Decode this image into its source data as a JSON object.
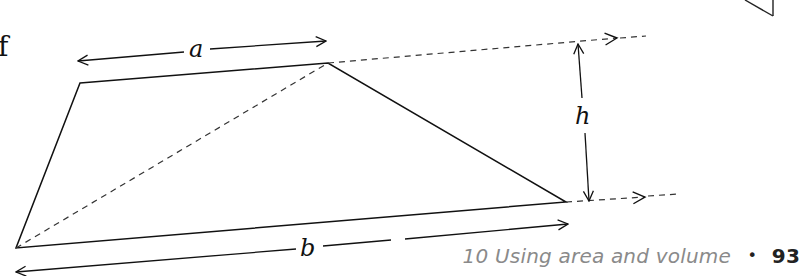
{
  "figure": {
    "stray_letter": "f",
    "labels": {
      "top_side": "a",
      "bottom_side": "b",
      "height": "h"
    },
    "shape": "trapezium",
    "vertices": {
      "top_left": [
        80,
        83
      ],
      "top_right": [
        328,
        63
      ],
      "bottom_right": [
        566,
        202
      ],
      "bottom_left": [
        16,
        248
      ]
    },
    "construction_lines": [
      "diagonal from bottom-left to top-right (dashed)",
      "extension of top side (dashed, arrow)",
      "extension of bottom side (dashed, arrow)"
    ],
    "colors": {
      "line": "#111111",
      "footer_text": "#8a8a8a",
      "page_number": "#222222"
    }
  },
  "footer": {
    "chapter_number": "10",
    "chapter_title": "Using area and volume",
    "separator": "•",
    "page_number": "93"
  }
}
